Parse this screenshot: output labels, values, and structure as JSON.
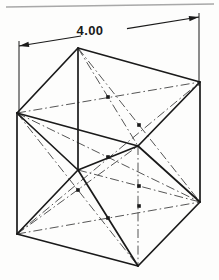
{
  "drawing": {
    "title": "Isometric cube with face and body diagonals",
    "type": "engineering-orthographic-pictorial",
    "background_color": "#fdfdfc",
    "line_color": "#1a1a1a",
    "centerline_color": "#555555",
    "artifact_color": "#9a9a9a",
    "dimension": {
      "label": "4.00",
      "label_x": 90,
      "label_y": 35,
      "arrow_start": {
        "x": 19,
        "y": 46
      },
      "arrow_end": {
        "x": 199,
        "y": 17
      },
      "extension_left": {
        "x1": 19,
        "y1": 41,
        "x2": 19,
        "y2": 116
      },
      "extension_right": {
        "x1": 199,
        "y1": 13,
        "x2": 199,
        "y2": 86
      }
    },
    "vertices": {
      "top_back": {
        "name": "A",
        "x": 78,
        "y": 48
      },
      "right_back": {
        "name": "B",
        "x": 200,
        "y": 82
      },
      "left_back": {
        "name": "C",
        "x": 17,
        "y": 113
      },
      "center_hidden": {
        "name": "D",
        "x": 138,
        "y": 146
      },
      "left_front": {
        "name": "E",
        "x": 78,
        "y": 170
      },
      "bottom_left": {
        "name": "F",
        "x": 17,
        "y": 234
      },
      "right_front": {
        "name": "G",
        "x": 200,
        "y": 202
      },
      "bottom_front": {
        "name": "H",
        "x": 138,
        "y": 266
      }
    },
    "solid_edges": [
      [
        "top_back",
        "right_back"
      ],
      [
        "top_back",
        "left_back"
      ],
      [
        "top_back",
        "left_front"
      ],
      [
        "left_back",
        "center_hidden"
      ],
      [
        "right_back",
        "center_hidden"
      ],
      [
        "left_back",
        "left_front"
      ],
      [
        "left_back",
        "bottom_left"
      ],
      [
        "left_front",
        "center_hidden"
      ],
      [
        "left_front",
        "bottom_front"
      ],
      [
        "right_back",
        "right_front"
      ],
      [
        "center_hidden",
        "right_front"
      ],
      [
        "bottom_left",
        "bottom_front"
      ],
      [
        "bottom_left",
        "left_front"
      ],
      [
        "bottom_front",
        "right_front"
      ]
    ],
    "centerlines": [
      {
        "from": "left_back",
        "to": "right_back",
        "marker": {
          "x": 108,
          "y": 97
        }
      },
      {
        "from": "top_back",
        "to": "center_hidden",
        "marker": {
          "x": 108,
          "y": 97
        }
      },
      {
        "from": "top_back",
        "to": "right_front",
        "marker": {
          "x": 139,
          "y": 125
        }
      },
      {
        "from": "left_back",
        "to": "bottom_front",
        "marker": {
          "x": 78,
          "y": 190
        }
      },
      {
        "from": "left_back",
        "to": "right_front",
        "marker": {
          "x": 108,
          "y": 157
        }
      },
      {
        "from": "bottom_left",
        "to": "right_back",
        "marker": {
          "x": 108,
          "y": 157
        }
      },
      {
        "from": "bottom_left",
        "to": "center_hidden",
        "marker": {
          "x": 78,
          "y": 190
        }
      },
      {
        "from": "bottom_left",
        "to": "right_front",
        "marker": {
          "x": 108,
          "y": 218
        }
      },
      {
        "from": "left_front",
        "to": "right_front",
        "marker": {
          "x": 139,
          "y": 186
        }
      },
      {
        "from": "center_hidden",
        "to": "bottom_front",
        "marker": {
          "x": 139,
          "y": 206
        }
      }
    ],
    "scan_artifact": {
      "present": true,
      "x1": 6,
      "y1": 7,
      "x2": 214,
      "y2": 4
    }
  }
}
